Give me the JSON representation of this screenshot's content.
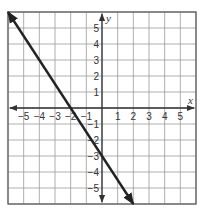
{
  "chart_data": {
    "type": "line",
    "title": "",
    "xlabel": "x",
    "ylabel": "y",
    "xlim": [
      -6,
      6
    ],
    "ylim": [
      -6,
      6
    ],
    "grid": true,
    "x_ticks": [
      -5,
      -4,
      -3,
      -2,
      -1,
      1,
      2,
      3,
      4,
      5
    ],
    "y_ticks": [
      5,
      4,
      3,
      2,
      1,
      -1,
      -2,
      -3,
      -4,
      -5
    ],
    "series": [
      {
        "name": "line",
        "equation": "y = -1.5x - 3",
        "slope": -1.5,
        "y_intercept": -3,
        "x_intercept": -2,
        "x": [
          -6,
          -2,
          0,
          2
        ],
        "y": [
          6,
          0,
          -3,
          -6
        ],
        "arrows_both_ends": true,
        "color": "#222222"
      }
    ]
  },
  "colors": {
    "grid": "#9a9a9a",
    "axes": "#333333",
    "border": "#555555",
    "line": "#222222"
  }
}
